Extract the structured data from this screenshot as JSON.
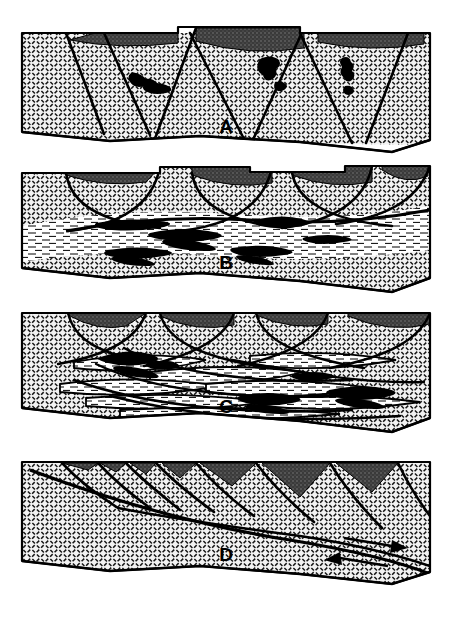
{
  "figure": {
    "type": "geological-cross-section-diagram",
    "width": 452,
    "height": 620,
    "background_color": "#ffffff",
    "ink_color": "#000000",
    "panel_count": 4
  },
  "colors": {
    "basement_fill": "#f2f2f2",
    "basement_hatch": "#1a1a1a",
    "cap_sediment_dark": "#3d3d3d",
    "cap_sediment_mid": "#6b6b6b",
    "melt_black": "#000000",
    "mylonite_fill": "#ffffff",
    "mylonite_dash": "#000000",
    "outline": "#000000"
  },
  "panels": [
    {
      "id": "panel-a",
      "label": "A",
      "label_x": 226,
      "label_y": 128,
      "stage": "initial high-angle planar normal faults with half-graben basin fill",
      "features": {
        "fault_count": 6,
        "fault_style": "high-angle planar normal faults",
        "basin_fill": true,
        "basin_fill_color": "#3d3d3d",
        "melt_bodies": 4,
        "mylonite_zone": false,
        "shear_arrows": 0
      },
      "frame": {
        "left": 22,
        "right": 430,
        "top": 33,
        "bottom": 140
      }
    },
    {
      "id": "panel-b",
      "label": "B",
      "label_x": 226,
      "label_y": 264,
      "stage": "listric faults soling into a sub-horizontal ductile shear zone",
      "features": {
        "fault_count": 5,
        "fault_style": "listric (concave-up) normal faults",
        "basin_fill": true,
        "basin_fill_color": "#3d3d3d",
        "melt_bodies": 7,
        "mylonite_zone": true,
        "mylonite_label": "sub-horizontal mylonitic detachment zone",
        "shear_arrows": 0
      },
      "frame": {
        "left": 22,
        "right": 430,
        "top": 172,
        "bottom": 290
      }
    },
    {
      "id": "panel-c",
      "label": "C",
      "label_x": 226,
      "label_y": 408,
      "stage": "anastomosing shear zones and imbricated extensional lenses",
      "features": {
        "fault_count": 8,
        "fault_style": "anastomosing / imbricate shear zones",
        "basin_fill": true,
        "basin_fill_color": "#3d3d3d",
        "melt_bodies": 5,
        "mylonite_zone": true,
        "mylonite_label": "braided anastomosing mylonite network",
        "shear_arrows": 0
      },
      "frame": {
        "left": 22,
        "right": 430,
        "top": 312,
        "bottom": 430
      }
    },
    {
      "id": "panel-d",
      "label": "D",
      "label_x": 226,
      "label_y": 556,
      "stage": "through-going low-angle detachment with rotated domino blocks",
      "features": {
        "fault_count": 9,
        "fault_style": "rotated domino blocks above a low-angle detachment",
        "basin_fill": true,
        "basin_fill_color": "#3d3d3d",
        "melt_bodies": 0,
        "mylonite_zone": false,
        "shear_arrows": 2,
        "shear_arrow_sense": "top-to-the-left over bottom-to-the-right (normal sense)"
      },
      "frame": {
        "left": 22,
        "right": 430,
        "top": 460,
        "bottom": 580
      }
    }
  ],
  "legend_notes": {
    "hatched_unit": "crystalline basement (diagonal dash crosshatch)",
    "dark_wedges": "syn-rift sedimentary basin fill",
    "black_lenses": "melt / magma bodies",
    "dashed_band": "mylonitic foliation"
  }
}
